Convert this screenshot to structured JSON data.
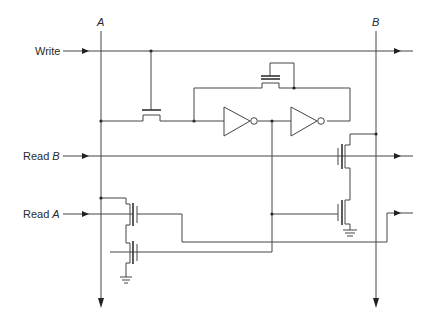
{
  "diagram": {
    "type": "circuit-schematic",
    "bus_labels": {
      "a": "A",
      "b": "B"
    },
    "signal_labels": {
      "write": "Write",
      "read_b_prefix": "Read",
      "read_b_suffix": "B",
      "read_a_prefix": "Read",
      "read_a_suffix": "A"
    },
    "components": [
      {
        "id": "write-pass-transistor",
        "kind": "nmos",
        "gate": "Write"
      },
      {
        "id": "feedback-transistor",
        "kind": "nmos"
      },
      {
        "id": "inverter-1",
        "kind": "inverter"
      },
      {
        "id": "inverter-2",
        "kind": "inverter"
      },
      {
        "id": "read-b-transistor-top",
        "kind": "nmos",
        "gate": "Read B"
      },
      {
        "id": "read-b-transistor-bottom",
        "kind": "nmos"
      },
      {
        "id": "read-a-transistor-top",
        "kind": "nmos",
        "gate": "Read A"
      },
      {
        "id": "read-a-transistor-bottom",
        "kind": "nmos"
      },
      {
        "id": "ground-left",
        "kind": "ground"
      },
      {
        "id": "ground-right",
        "kind": "ground"
      }
    ],
    "colors": {
      "line": "#444444",
      "background": "#ffffff"
    }
  }
}
